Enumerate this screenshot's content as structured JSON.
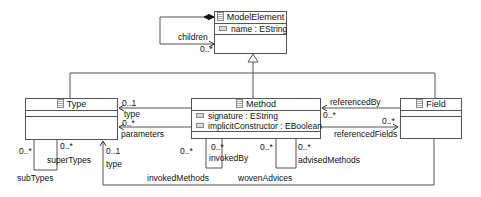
{
  "classes": {
    "model_element": {
      "name": "ModelElement",
      "attributes": [
        "name : EString"
      ]
    },
    "type": {
      "name": "Type",
      "attributes": []
    },
    "method": {
      "name": "Method",
      "attributes": [
        "signature : EString",
        "implicitConstructor : EBoolean"
      ]
    },
    "field": {
      "name": "Field",
      "attributes": []
    }
  },
  "associations": {
    "children": {
      "role": "children",
      "multiplicity": "0..*"
    },
    "method_type": {
      "role": "type",
      "multiplicity": "0..1"
    },
    "method_parameters": {
      "role": "parameters",
      "multiplicity": "0..*"
    },
    "field_type": {
      "role": "type",
      "multiplicity": "0..1"
    },
    "referenced_by": {
      "role": "referencedBy",
      "multiplicity": "0..*"
    },
    "referenced_fields": {
      "role": "referencedFields",
      "multiplicity": "0..*"
    },
    "sub_types": {
      "role": "subTypes",
      "multiplicity": "0..*"
    },
    "super_types": {
      "role": "superTypes",
      "multiplicity": "0..*"
    },
    "invoked_methods": {
      "role": "invokedMethods",
      "multiplicity": "0..*"
    },
    "invoked_by": {
      "role": "invokedBy",
      "multiplicity": "0..*"
    },
    "woven_advices": {
      "role": "wovenAdvices",
      "multiplicity": "0..*"
    },
    "advised_methods": {
      "role": "advisedMethods",
      "multiplicity": "0..*"
    }
  }
}
